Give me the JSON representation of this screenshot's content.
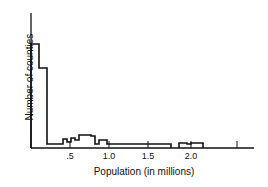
{
  "chart_data": {
    "type": "bar",
    "subtype": "histogram",
    "title": "",
    "xlabel": "Population (in millions)",
    "ylabel": "Number of counties",
    "x_ticks": [
      ".5",
      "1.0",
      "1.5",
      "2.0",
      ""
    ],
    "x_tick_values": [
      0.5,
      1.0,
      1.5,
      2.0,
      2.5
    ],
    "xlim": [
      0,
      2.8
    ],
    "y_ticks": [],
    "grid": false,
    "legend": null,
    "note": "Y axis unlabeled; bar heights are relative units (pixel estimates).",
    "bins": [
      {
        "x0": 0.0,
        "x1": 0.1,
        "value": 104
      },
      {
        "x0": 0.1,
        "x1": 0.2,
        "value": 80
      },
      {
        "x0": 0.2,
        "x1": 0.4,
        "value": 4
      },
      {
        "x0": 0.4,
        "x1": 0.45,
        "value": 9
      },
      {
        "x0": 0.45,
        "x1": 0.5,
        "value": 6
      },
      {
        "x0": 0.5,
        "x1": 0.55,
        "value": 10
      },
      {
        "x0": 0.55,
        "x1": 0.6,
        "value": 8
      },
      {
        "x0": 0.6,
        "x1": 0.75,
        "value": 13
      },
      {
        "x0": 0.75,
        "x1": 0.8,
        "value": 12
      },
      {
        "x0": 0.8,
        "x1": 0.85,
        "value": 4
      },
      {
        "x0": 0.85,
        "x1": 0.95,
        "value": 8
      },
      {
        "x0": 0.95,
        "x1": 1.6,
        "value": 4
      },
      {
        "x0": 1.6,
        "x1": 1.75,
        "value": 4
      },
      {
        "x0": 1.75,
        "x1": 1.85,
        "value": 0
      },
      {
        "x0": 1.85,
        "x1": 1.95,
        "value": 5
      },
      {
        "x0": 1.95,
        "x1": 2.0,
        "value": 4
      },
      {
        "x0": 2.0,
        "x1": 2.15,
        "value": 5
      }
    ]
  },
  "labels": {
    "xlabel": "Population (in millions)",
    "ylabel": "Number of counties",
    "ticks": [
      ".5",
      "1.0",
      "1.5",
      "2.0"
    ]
  }
}
